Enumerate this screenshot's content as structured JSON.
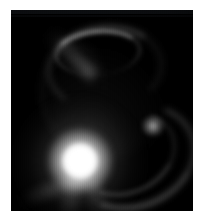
{
  "image": {
    "kind": "astronomical-observation",
    "modality": "grayscale-intensity",
    "caption": "Grayscale astronomical image of a bright central point source surrounded by a faint circumstellar ring arc, a sweeping lower-right arc, a small companion point source, and diffuse tails.",
    "frame": {
      "background_color": "#000000",
      "border_color": "#ffffff",
      "left": 11,
      "top": 10,
      "width": 182,
      "height": 201
    },
    "features": [
      {
        "id": "central-source",
        "label": "Central bright source",
        "center_x": 69,
        "center_y": 151,
        "peak_color": "#ffffff",
        "relative_brightness": 1.0
      },
      {
        "id": "ring-arc",
        "label": "Upper ring arc",
        "center_x": 91,
        "center_y": 55,
        "peak_color": "#b4b4b4",
        "relative_brightness": 0.28
      },
      {
        "id": "sweep-arc",
        "label": "Lower-right sweeping arc",
        "center_x": 119,
        "center_y": 144,
        "peak_color": "#9b9b9b",
        "relative_brightness": 0.22
      },
      {
        "id": "companion",
        "label": "Companion point source",
        "center_x": 142,
        "center_y": 116,
        "peak_color": "#c8c8c8",
        "relative_brightness": 0.3
      },
      {
        "id": "tail-upper-left",
        "label": "Upper-left diffuse streak",
        "center_x": 45,
        "center_y": 72,
        "peak_color": "#6e6e6e",
        "relative_brightness": 0.12
      },
      {
        "id": "tail-lower-left",
        "label": "Lower-left diffuse streak",
        "center_x": 40,
        "center_y": 168,
        "peak_color": "#7a7a7a",
        "relative_brightness": 0.14
      },
      {
        "id": "tail-lower",
        "label": "Lower diffuse tail",
        "center_x": 68,
        "center_y": 192,
        "peak_color": "#6a6a6a",
        "relative_brightness": 0.11
      }
    ]
  }
}
